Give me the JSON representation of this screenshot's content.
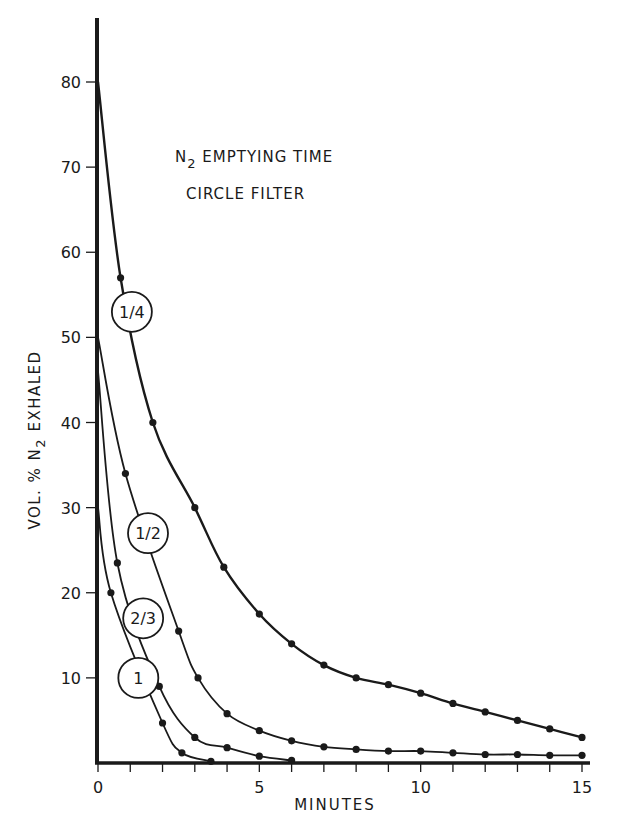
{
  "chart_data": {
    "type": "line",
    "title": "N2 EMPTYING TIME",
    "title_main": "N",
    "title_sub": "2",
    "title_rest": " EMPTYING TIME",
    "subtitle": "CIRCLE FILTER",
    "xlabel": "MINUTES",
    "ylabel": "VOL. % N2 EXHALED",
    "ylabel_pre": "VOL. % N",
    "ylabel_sub": "2",
    "ylabel_post": " EXHALED",
    "xlim": [
      0,
      15
    ],
    "ylim": [
      0,
      85
    ],
    "x_ticks": [
      0,
      5,
      10,
      15
    ],
    "x_minor_ticks": [
      1,
      2,
      3,
      4,
      6,
      7,
      8,
      9,
      11,
      12,
      13,
      14
    ],
    "y_ticks": [
      10,
      20,
      30,
      40,
      50,
      60,
      70,
      80
    ],
    "grid": false,
    "legend": "inline circled labels on curves",
    "series": [
      {
        "name": "1/4",
        "label_pos": [
          1.05,
          53
        ],
        "start": [
          0,
          80
        ],
        "points": [
          [
            0.7,
            57
          ],
          [
            1.7,
            40
          ],
          [
            3.0,
            30
          ],
          [
            3.9,
            23
          ],
          [
            5.0,
            17.5
          ],
          [
            6.0,
            14
          ],
          [
            7.0,
            11.5
          ],
          [
            8.0,
            10
          ],
          [
            9.0,
            9.2
          ],
          [
            10.0,
            8.2
          ],
          [
            11.0,
            7
          ],
          [
            12.0,
            6
          ],
          [
            13.0,
            5
          ],
          [
            14.0,
            4
          ],
          [
            15.0,
            3
          ]
        ]
      },
      {
        "name": "1/2",
        "label_pos": [
          1.55,
          27
        ],
        "start": [
          0,
          50
        ],
        "points": [
          [
            0.85,
            34
          ],
          [
            2.5,
            15.5
          ],
          [
            3.1,
            10
          ],
          [
            4.0,
            5.8
          ],
          [
            5.0,
            3.8
          ],
          [
            6.0,
            2.6
          ],
          [
            7.0,
            1.9
          ],
          [
            8.0,
            1.6
          ],
          [
            9.0,
            1.4
          ],
          [
            10.0,
            1.4
          ],
          [
            11.0,
            1.2
          ],
          [
            12.0,
            1.0
          ],
          [
            13.0,
            1.0
          ],
          [
            14.0,
            0.9
          ],
          [
            15.0,
            0.9
          ]
        ]
      },
      {
        "name": "2/3",
        "label_pos": [
          1.4,
          17
        ],
        "start": [
          0,
          46
        ],
        "points": [
          [
            0.6,
            23.5
          ],
          [
            1.9,
            9
          ],
          [
            3.0,
            3.0
          ],
          [
            4.0,
            1.8
          ],
          [
            5.0,
            0.8
          ],
          [
            6.0,
            0.3
          ]
        ]
      },
      {
        "name": "1",
        "label_pos": [
          1.25,
          10
        ],
        "start": [
          0,
          30
        ],
        "points": [
          [
            0.4,
            20
          ],
          [
            2.0,
            4.7
          ],
          [
            2.6,
            1.2
          ],
          [
            3.5,
            0.2
          ]
        ]
      }
    ]
  }
}
